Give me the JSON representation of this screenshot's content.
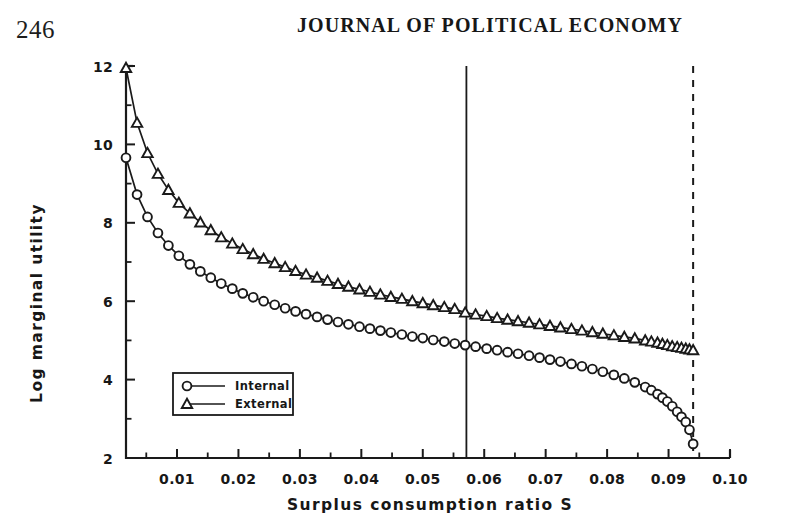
{
  "header": {
    "page_number": "246",
    "journal_title": "JOURNAL OF POLITICAL ECONOMY"
  },
  "chart_data": {
    "type": "line",
    "title": "",
    "xlabel": "Surplus consumption ratio S",
    "ylabel": "Log marginal utility",
    "xlim": [
      0.0017,
      0.1
    ],
    "ylim": [
      2,
      12
    ],
    "xticks": [
      0.01,
      0.02,
      0.03,
      0.04,
      0.05,
      0.06,
      0.07,
      0.08,
      0.09,
      0.1
    ],
    "xtick_labels": [
      "0.01",
      "0.02",
      "0.03",
      "0.04",
      "0.05",
      "0.06",
      "0.07",
      "0.08",
      "0.09",
      "0.10"
    ],
    "xminor_step": 0.005,
    "yticks": [
      2,
      4,
      6,
      8,
      10,
      12
    ],
    "ytick_labels": [
      "2",
      "4",
      "6",
      "8",
      "10",
      "12"
    ],
    "yminor_step": 1,
    "grid": false,
    "legend_position": "lower-left",
    "marker_colors": {
      "internal": "#1a1a1a",
      "external": "#1a1a1a"
    },
    "annotations": [
      {
        "name": "steady-state-line",
        "type": "vline",
        "x": 0.0571,
        "style": "solid"
      },
      {
        "name": "smax-line",
        "type": "vline",
        "x": 0.094,
        "style": "dashed"
      }
    ],
    "series": [
      {
        "name": "Internal",
        "marker": "circle",
        "x": [
          0.0017,
          0.0035,
          0.0052,
          0.0069,
          0.0086,
          0.0103,
          0.0121,
          0.0138,
          0.0155,
          0.0172,
          0.019,
          0.0207,
          0.0224,
          0.0241,
          0.0259,
          0.0276,
          0.0293,
          0.031,
          0.0328,
          0.0345,
          0.0362,
          0.0379,
          0.0397,
          0.0414,
          0.0431,
          0.0448,
          0.0466,
          0.0483,
          0.05,
          0.0517,
          0.0535,
          0.0552,
          0.0569,
          0.0586,
          0.0604,
          0.0621,
          0.0638,
          0.0655,
          0.0673,
          0.069,
          0.0707,
          0.0724,
          0.0742,
          0.0759,
          0.0776,
          0.0793,
          0.0811,
          0.0828,
          0.0845,
          0.0862,
          0.0872,
          0.0882,
          0.089,
          0.0898,
          0.0906,
          0.0914,
          0.0921,
          0.0928,
          0.0934,
          0.094
        ],
        "y": [
          9.66,
          8.72,
          8.15,
          7.74,
          7.42,
          7.16,
          6.94,
          6.76,
          6.6,
          6.45,
          6.32,
          6.2,
          6.1,
          6.0,
          5.91,
          5.82,
          5.74,
          5.67,
          5.6,
          5.53,
          5.47,
          5.41,
          5.35,
          5.3,
          5.25,
          5.2,
          5.15,
          5.1,
          5.06,
          5.01,
          4.97,
          4.92,
          4.88,
          4.84,
          4.79,
          4.75,
          4.7,
          4.66,
          4.61,
          4.56,
          4.51,
          4.46,
          4.4,
          4.34,
          4.27,
          4.2,
          4.12,
          4.03,
          3.93,
          3.81,
          3.73,
          3.63,
          3.54,
          3.44,
          3.32,
          3.18,
          3.05,
          2.92,
          2.72,
          2.36
        ]
      },
      {
        "name": "External",
        "marker": "triangle",
        "x": [
          0.0017,
          0.0035,
          0.0052,
          0.0069,
          0.0086,
          0.0103,
          0.0121,
          0.0138,
          0.0155,
          0.0172,
          0.019,
          0.0207,
          0.0224,
          0.0241,
          0.0259,
          0.0276,
          0.0293,
          0.031,
          0.0328,
          0.0345,
          0.0362,
          0.0379,
          0.0397,
          0.0414,
          0.0431,
          0.0448,
          0.0466,
          0.0483,
          0.05,
          0.0517,
          0.0535,
          0.0552,
          0.0569,
          0.0586,
          0.0604,
          0.0621,
          0.0638,
          0.0655,
          0.0673,
          0.069,
          0.0707,
          0.0724,
          0.0742,
          0.0759,
          0.0776,
          0.0793,
          0.0811,
          0.0828,
          0.0845,
          0.0862,
          0.0872,
          0.0882,
          0.089,
          0.0898,
          0.0906,
          0.0914,
          0.0921,
          0.0928,
          0.0934,
          0.094
        ],
        "y": [
          11.95,
          10.55,
          9.78,
          9.25,
          8.84,
          8.51,
          8.24,
          8.01,
          7.81,
          7.63,
          7.47,
          7.33,
          7.2,
          7.08,
          6.97,
          6.87,
          6.77,
          6.68,
          6.6,
          6.52,
          6.44,
          6.37,
          6.3,
          6.24,
          6.17,
          6.11,
          6.06,
          6.0,
          5.95,
          5.9,
          5.85,
          5.8,
          5.71,
          5.66,
          5.62,
          5.57,
          5.53,
          5.49,
          5.45,
          5.41,
          5.37,
          5.33,
          5.29,
          5.25,
          5.21,
          5.17,
          5.13,
          5.09,
          5.05,
          5.0,
          4.97,
          4.94,
          4.91,
          4.88,
          4.85,
          4.83,
          4.81,
          4.79,
          4.77,
          4.75
        ]
      }
    ],
    "legend": [
      {
        "label": "Internal",
        "marker": "circle"
      },
      {
        "label": "External",
        "marker": "triangle"
      }
    ]
  }
}
